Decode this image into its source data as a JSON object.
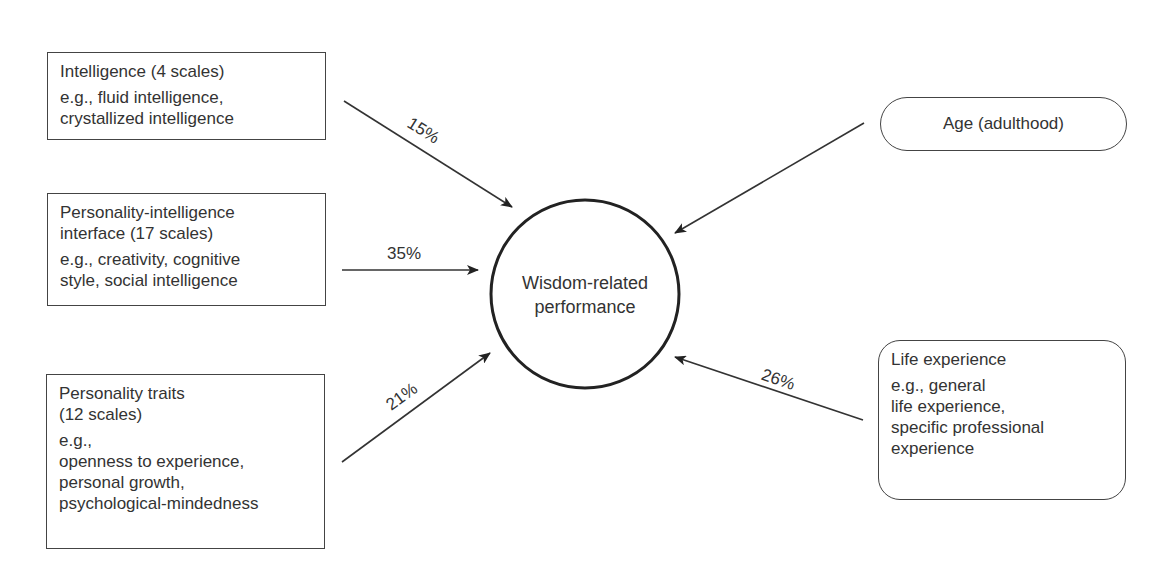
{
  "diagram": {
    "center": {
      "label": "Wisdom-related\nperformance"
    },
    "predictors": [
      {
        "title": "Intelligence (4 scales)",
        "desc": "e.g., fluid intelligence,\ncrystallized intelligence",
        "percent": "15%"
      },
      {
        "title": "Personality-intelligence\ninterface (17 scales)",
        "desc": "e.g., creativity, cognitive\nstyle, social intelligence",
        "percent": "35%"
      },
      {
        "title": "Personality traits\n(12 scales)",
        "desc": "e.g.,\nopenness to experience,\npersonal growth,\npsychological-mindedness",
        "percent": "21%"
      },
      {
        "title": "Age (adulthood)",
        "desc": "",
        "percent": ""
      },
      {
        "title": "Life experience",
        "desc": "e.g., general\nlife experience,\nspecific professional\nexperience",
        "percent": "26%"
      }
    ]
  }
}
